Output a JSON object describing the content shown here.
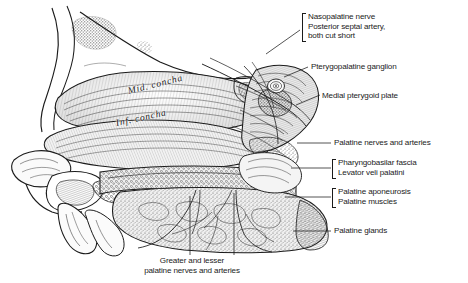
{
  "figure": {
    "domain": "anatomical-illustration",
    "style": "pen-and-ink stipple and hatching, monochrome",
    "background_color": "#ffffff",
    "ink_color": "#1b1b1b",
    "width": 468,
    "height": 283
  },
  "in_figure_labels": [
    {
      "text": "Mid. concha",
      "x": 128,
      "y": 92,
      "rotation": -14
    },
    {
      "text": "Inf. concha",
      "x": 116,
      "y": 124,
      "rotation": -12
    }
  ],
  "callouts": [
    {
      "name": "nasopalatine-nerve",
      "lines": [
        "Nasopalatine nerve",
        "Posterior septal artery,",
        "both cut short"
      ],
      "bracket": true,
      "x": 308,
      "y": 12,
      "leader": {
        "x1": 268,
        "y1": 52,
        "x2": 300,
        "y2": 30,
        "type": "diagonal"
      }
    },
    {
      "name": "pterygopalatine-ganglion",
      "lines": [
        "Pterygopalatine ganglion"
      ],
      "bracket": false,
      "x": 311,
      "y": 64,
      "leader": {
        "x1": 283,
        "y1": 76,
        "x2": 308,
        "y2": 66,
        "type": "diagonal"
      }
    },
    {
      "name": "medial-pterygoid-plate",
      "lines": [
        "Medial pterygoid plate"
      ],
      "bracket": false,
      "x": 322,
      "y": 93,
      "leader": {
        "x1": 295,
        "y1": 104,
        "x2": 319,
        "y2": 95,
        "type": "diagonal"
      }
    },
    {
      "name": "palatine-nerves-and-arteries",
      "lines": [
        "Palatine nerves and arteries"
      ],
      "bracket": false,
      "x": 334,
      "y": 139,
      "leader": {
        "x1": 296,
        "y1": 143,
        "x2": 331,
        "y2": 143,
        "type": "horizontal"
      }
    },
    {
      "name": "pharyngobasilar-fascia-levator-veli-palatini",
      "lines": [
        "Pharyngobasilar fascia",
        "Levator veli palatini"
      ],
      "bracket": true,
      "x": 338,
      "y": 159,
      "leader": {
        "x1": 290,
        "y1": 168,
        "x2": 330,
        "y2": 168,
        "type": "horizontal"
      }
    },
    {
      "name": "palatine-aponeurosis-palatine-muscles",
      "lines": [
        "Palatine aponeurosis",
        "Palatine muscles"
      ],
      "bracket": true,
      "x": 338,
      "y": 188,
      "leader": {
        "x1": 284,
        "y1": 197,
        "x2": 330,
        "y2": 197,
        "type": "horizontal"
      }
    },
    {
      "name": "palatine-glands",
      "lines": [
        "Palatine glands"
      ],
      "bracket": false,
      "x": 334,
      "y": 227,
      "leader": {
        "x1": 292,
        "y1": 231,
        "x2": 331,
        "y2": 231,
        "type": "horizontal"
      }
    }
  ],
  "bottom_caption": {
    "name": "greater-and-lesser-palatine-nerves-and-arteries",
    "lines": [
      "Greater and lesser",
      "palatine nerves and arteries"
    ],
    "x": 192,
    "y": 258,
    "leaders": [
      {
        "x1": 190,
        "y1": 195,
        "x2": 190,
        "y2": 256
      },
      {
        "x1": 234,
        "y1": 192,
        "x2": 234,
        "y2": 256
      }
    ]
  }
}
